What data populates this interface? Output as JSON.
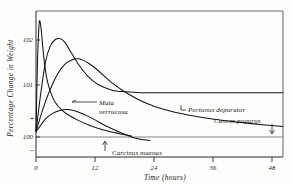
{
  "figure": {
    "background_color": "#fdfdfb",
    "ink_color": "#151515"
  },
  "chart_data": {
    "type": "line",
    "title": "",
    "xlabel": "Time (hours)",
    "ylabel": "Percentage Change in Weight",
    "xlim": [
      0,
      52
    ],
    "ylim": [
      99.4,
      102.85
    ],
    "grid": false,
    "legend_position": "inline-annotations",
    "xticks": [
      0,
      12,
      24,
      36,
      48
    ],
    "xtick_labels": [
      "0",
      "12",
      "24",
      "36",
      "48"
    ],
    "yticks": [
      102,
      101,
      100
    ],
    "ytick_labels": [
      "102",
      "101",
      "100"
    ],
    "y_sign_labels": [
      "+",
      "–"
    ],
    "baseline_value": 100,
    "series": [
      {
        "name": "Maia verrucosa",
        "label": "Maia verrucosa",
        "label_line1": "Maia",
        "label_line2": "verrucosa",
        "peak_time": 0.8,
        "peak_value": 102.62,
        "x": [
          0,
          0.3,
          0.6,
          0.8,
          1.1,
          1.6,
          2.2,
          3.0,
          4.0,
          5.5,
          7.0,
          9.0,
          11.0,
          13.0,
          15.5,
          18.0,
          20.0
        ],
        "y": [
          100.0,
          101.6,
          102.45,
          102.62,
          102.4,
          101.8,
          101.3,
          100.95,
          100.7,
          100.5,
          100.38,
          100.26,
          100.16,
          100.08,
          100.0,
          99.94,
          99.9
        ]
      },
      {
        "name": "Portunus depurator",
        "label": "Portunus depurator",
        "peak_time": 5.0,
        "peak_value": 102.2,
        "plateau_value": 100.92,
        "x": [
          0,
          1.0,
          2.0,
          3.0,
          4.0,
          5.0,
          6.0,
          7.5,
          9.0,
          11.0,
          13.0,
          16.0,
          19.0,
          22.0,
          26.0,
          30.0,
          35.0,
          40.0,
          46.0,
          52.0
        ],
        "y": [
          100.0,
          100.9,
          101.65,
          102.02,
          102.17,
          102.2,
          102.12,
          101.85,
          101.58,
          101.3,
          101.12,
          100.98,
          100.94,
          100.92,
          100.92,
          100.92,
          100.92,
          100.92,
          100.92,
          100.92
        ]
      },
      {
        "name": "Cancer pagurus",
        "label": "Cancer pagurus",
        "peak_time": 9.0,
        "peak_value": 101.72,
        "x": [
          0,
          1.5,
          3.0,
          4.5,
          6.0,
          7.5,
          9.0,
          11.0,
          13.0,
          16.0,
          19.0,
          23.0,
          27.0,
          32.0,
          37.0,
          42.0,
          47.0,
          52.0
        ],
        "y": [
          100.0,
          100.55,
          101.0,
          101.35,
          101.58,
          101.69,
          101.72,
          101.62,
          101.45,
          101.15,
          100.92,
          100.68,
          100.52,
          100.39,
          100.3,
          100.23,
          100.17,
          100.12
        ]
      },
      {
        "name": "Carcinus maenas",
        "label": "Carcinus maenas",
        "peak_time": 7.0,
        "peak_value": 100.52,
        "x": [
          0,
          1.0,
          2.0,
          3.5,
          5.0,
          6.5,
          7.5,
          9.0,
          11.0,
          13.0,
          15.0,
          17.5,
          20.0,
          22.0,
          24.0
        ],
        "y": [
          100.0,
          100.15,
          100.3,
          100.43,
          100.5,
          100.52,
          100.51,
          100.46,
          100.36,
          100.24,
          100.12,
          99.99,
          99.88,
          99.82,
          99.79
        ]
      }
    ],
    "annotations": [
      {
        "name": "maia-annotation",
        "text": "Maia verrucosa",
        "style": "leader-line-left"
      },
      {
        "name": "portunus-annotation",
        "text": "Portunus depurator",
        "style": "bracket-left"
      },
      {
        "name": "cancer-annotation",
        "text": "Cancer pagurus",
        "style": "arrow-down"
      },
      {
        "name": "carcinus-annotation",
        "text": "Carcinus maenas",
        "style": "arrow-up"
      }
    ]
  }
}
